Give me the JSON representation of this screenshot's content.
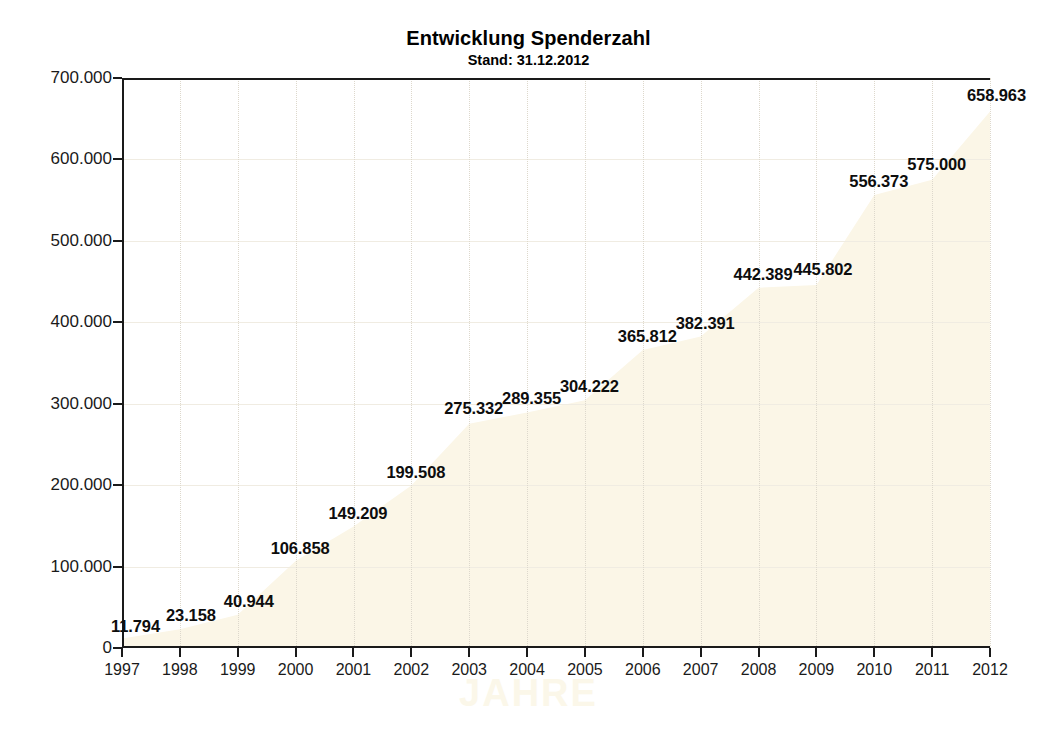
{
  "chart_data": {
    "type": "area",
    "title": "Entwicklung Spenderzahl",
    "subtitle": "Stand: 31.12.2012",
    "xlabel": "JAHRE",
    "ylabel": "",
    "categories": [
      "1997",
      "1998",
      "1999",
      "2000",
      "2001",
      "2002",
      "2003",
      "2004",
      "2005",
      "2006",
      "2007",
      "2008",
      "2009",
      "2010",
      "2011",
      "2012"
    ],
    "values": [
      11794,
      23158,
      40944,
      106858,
      149209,
      199508,
      275332,
      289355,
      304222,
      365812,
      382391,
      442389,
      445802,
      556373,
      575000,
      658963
    ],
    "value_labels": [
      "11.794",
      "23.158",
      "40.944",
      "106.858",
      "149.209",
      "199.508",
      "275.332",
      "289.355",
      "304.222",
      "365.812",
      "382.391",
      "442.389",
      "445.802",
      "556.373",
      "575.000",
      "658.963"
    ],
    "ylim": [
      0,
      700000
    ],
    "yticks": [
      0,
      100000,
      200000,
      300000,
      400000,
      500000,
      600000,
      700000
    ],
    "ytick_labels": [
      "0",
      "100.000",
      "200.000",
      "300.000",
      "400.000",
      "500.000",
      "600.000",
      "700.000"
    ],
    "grid": true,
    "legend": "none",
    "area_fill_color": "#fbf6e7",
    "axis_color": "#1a1a1a",
    "label_color": "#0d0d0d",
    "background_color": "#ffffff"
  }
}
